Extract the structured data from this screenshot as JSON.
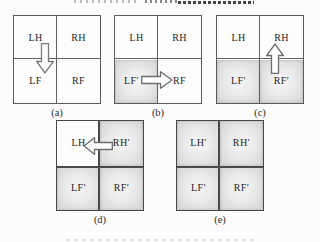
{
  "figure": {
    "colors": {
      "line": "#5b5b5b",
      "shaded_fill": "#e3e3e3",
      "text": "#252525",
      "arrow_outline": "#787878"
    },
    "panels": [
      {
        "caption": "(a)",
        "arrow": "down",
        "quadrants": [
          {
            "label": "LH",
            "shaded": false
          },
          {
            "label": "RH",
            "shaded": false
          },
          {
            "label": "LF",
            "shaded": false
          },
          {
            "label": "RF",
            "shaded": false
          }
        ]
      },
      {
        "caption": "(b)",
        "arrow": "right",
        "quadrants": [
          {
            "label": "LH",
            "shaded": false
          },
          {
            "label": "RH",
            "shaded": false
          },
          {
            "label": "LF′",
            "shaded": true
          },
          {
            "label": "RF",
            "shaded": false
          }
        ]
      },
      {
        "caption": "(c)",
        "arrow": "up",
        "quadrants": [
          {
            "label": "LH",
            "shaded": false
          },
          {
            "label": "RH",
            "shaded": false
          },
          {
            "label": "LF′",
            "shaded": true
          },
          {
            "label": "RF′",
            "shaded": true
          }
        ]
      },
      {
        "caption": "(d)",
        "arrow": "left",
        "quadrants": [
          {
            "label": "LH",
            "shaded": false
          },
          {
            "label": "RH′",
            "shaded": true
          },
          {
            "label": "LF′",
            "shaded": true
          },
          {
            "label": "RF′",
            "shaded": true
          }
        ]
      },
      {
        "caption": "(e)",
        "arrow": "none",
        "quadrants": [
          {
            "label": "LH′",
            "shaded": true
          },
          {
            "label": "RH′",
            "shaded": true
          },
          {
            "label": "LF′",
            "shaded": true
          },
          {
            "label": "RF′",
            "shaded": true
          }
        ]
      }
    ]
  }
}
